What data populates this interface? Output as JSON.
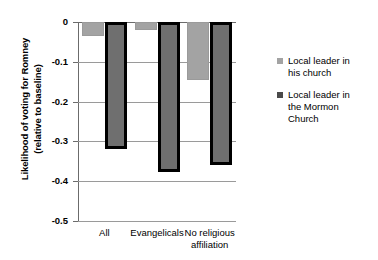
{
  "chart_data": {
    "type": "bar",
    "title": "",
    "xlabel": "",
    "ylabel": "Likelihood of voting for Romney (relative to baseline)",
    "ylabel_line1": "Likelihood of voting for Romney",
    "ylabel_line2": "(relative to baseline)",
    "categories": [
      "All",
      "Evangelicals",
      "No religious affiliation"
    ],
    "category_labels": [
      {
        "line1": "All",
        "line2": ""
      },
      {
        "line1": "Evangelicals",
        "line2": ""
      },
      {
        "line1": "No religious",
        "line2": "affiliation"
      }
    ],
    "series": [
      {
        "name": "Local leader in his church",
        "name_line1": "Local leader in",
        "name_line2": "his church",
        "name_line3": "",
        "color": "#a3a3a3",
        "values": [
          -0.035,
          -0.02,
          -0.145
        ]
      },
      {
        "name": "Local leader in the Mormon Church",
        "name_line1": "Local leader in",
        "name_line2": "the Mormon",
        "name_line3": "Church",
        "color": "#6f6f6f",
        "values": [
          -0.32,
          -0.377,
          -0.36
        ]
      }
    ],
    "ylim": [
      -0.5,
      0
    ],
    "yticks": [
      0,
      -0.1,
      -0.2,
      -0.3,
      -0.4,
      -0.5
    ],
    "ytick_labels": [
      "0",
      "-0.1",
      "-0.2",
      "-0.3",
      "-0.4",
      "-0.5"
    ],
    "grid": true,
    "legend_position": "right"
  }
}
